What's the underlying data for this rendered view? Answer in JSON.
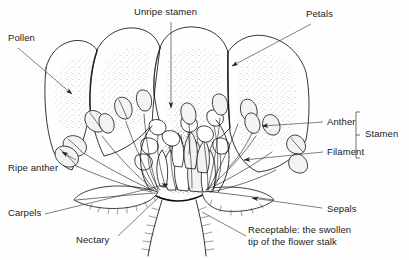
{
  "diagram": {
    "style": "black-and-white line drawing",
    "background_color": "#ffffff",
    "ink_color": "#111111",
    "stipple_color": "#9a9a9a"
  },
  "labels": {
    "pollen": "Pollen",
    "unripe_stamen": "Unripe stamen",
    "petals": "Petals",
    "anther": "Anther",
    "filament": "Filament",
    "stamen": "Stamen",
    "ripe_anther": "Ripe anther",
    "carpels": "Carpels",
    "nectary": "Nectary",
    "sepals": "Sepals",
    "receptacle": "Receptable: the swollen tip of the flower stalk"
  },
  "parts": [
    {
      "name": "Pollen",
      "position": "top-left"
    },
    {
      "name": "Unripe stamen",
      "position": "top-center"
    },
    {
      "name": "Petals",
      "position": "top-right"
    },
    {
      "name": "Anther",
      "position": "right"
    },
    {
      "name": "Filament",
      "position": "right"
    },
    {
      "name": "Stamen",
      "position": "far-right",
      "bracket": "groups Anther and Filament"
    },
    {
      "name": "Ripe anther",
      "position": "left"
    },
    {
      "name": "Carpels",
      "position": "lower-left"
    },
    {
      "name": "Nectary",
      "position": "bottom-center"
    },
    {
      "name": "Sepals",
      "position": "bottom-right"
    },
    {
      "name": "Receptable: the swollen tip of the flower stalk",
      "position": "bottom-center-right"
    }
  ]
}
